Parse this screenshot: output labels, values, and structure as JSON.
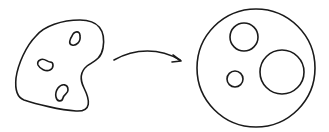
{
  "diagram": {
    "stroke_color": "#1a1a1a",
    "background": "#ffffff",
    "source_shape": {
      "type": "irregular-region",
      "hole_count": 3
    },
    "arrow": {
      "direction": "left-to-right",
      "meaning": "maps-to"
    },
    "target_shape": {
      "type": "disk",
      "outer": {
        "cx": 256,
        "cy": 68,
        "r": 59
      },
      "holes": [
        {
          "cx": 244,
          "cy": 37,
          "r": 14
        },
        {
          "cx": 282,
          "cy": 72,
          "r": 22
        },
        {
          "cx": 235,
          "cy": 79,
          "r": 8
        }
      ]
    }
  }
}
